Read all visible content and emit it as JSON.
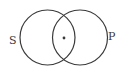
{
  "diagram": {
    "type": "venn",
    "sets": [
      {
        "label": "S",
        "cx": 47.5,
        "cy": 37.5,
        "r": 27.5
      },
      {
        "label": "P",
        "cx": 80,
        "cy": 37.5,
        "r": 27.5
      }
    ],
    "marker": {
      "region": "S∩P",
      "symbol": "dot",
      "x": 64,
      "y": 38
    },
    "colors": {
      "stroke": "#3a3a3a",
      "background": "#ffffff"
    }
  }
}
